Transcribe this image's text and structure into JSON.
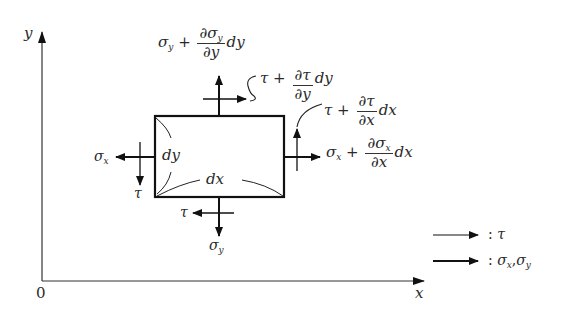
{
  "diagram": {
    "axes": {
      "origin_label": "0",
      "x_label": "x",
      "y_label": "y"
    },
    "element": {
      "width_label": "dx",
      "height_label": "dy"
    },
    "top_face": {
      "normal_stress": {
        "base": "σ",
        "sub": "y",
        "plus": "+",
        "num": "∂σ",
        "num_sub": "y",
        "den": "∂y",
        "tail": "dy"
      },
      "shear_stress": {
        "base": "τ",
        "plus": "+",
        "num": "∂τ",
        "den": "∂y",
        "tail": "dy"
      }
    },
    "right_face": {
      "normal_stress": {
        "base": "σ",
        "sub": "x",
        "plus": "+",
        "num": "∂σ",
        "num_sub": "x",
        "den": "∂x",
        "tail": "dx"
      },
      "shear_stress": {
        "base": "τ",
        "plus": "+",
        "num": "∂τ",
        "den": "∂x",
        "tail": "dx"
      }
    },
    "left_face": {
      "normal_stress": {
        "base": "σ",
        "sub": "x"
      },
      "shear_stress": {
        "base": "τ"
      }
    },
    "bottom_face": {
      "normal_stress": {
        "base": "σ",
        "sub": "y"
      },
      "shear_stress": {
        "base": "τ"
      }
    },
    "legend": [
      {
        "arrow": "thin-arrow",
        "separator": ":",
        "label": "τ"
      },
      {
        "arrow": "thick-arrow",
        "separator": ":",
        "label_parts": [
          "σ",
          "x",
          ",",
          "σ",
          "y"
        ]
      }
    ],
    "colors": {
      "ink": "#222222",
      "background": "#ffffff"
    }
  }
}
